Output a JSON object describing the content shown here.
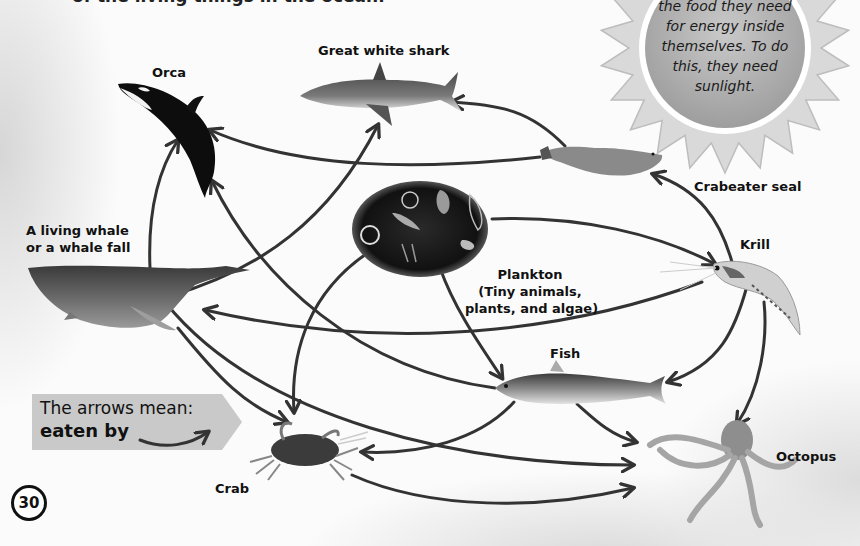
{
  "intro_text": "of the living things in the ocean.",
  "sun_box": {
    "lines": [
      "the food they need",
      "for energy inside",
      "themselves. To do",
      "this, they need",
      "sunlight."
    ]
  },
  "organisms": {
    "orca": "Orca",
    "shark": "Great white shark",
    "seal": "Crabeater seal",
    "krill": "Krill",
    "whale_line1": "A living whale",
    "whale_line2": "or a whale fall",
    "plankton_line1": "Plankton",
    "plankton_line2": "(Tiny animals,",
    "plankton_line3": "plants, and algae)",
    "fish": "Fish",
    "crab": "Crab",
    "octopus": "Octopus"
  },
  "legend": {
    "line1": "The arrows mean:",
    "line2": "eaten by"
  },
  "page_number": "30",
  "food_web_links": [
    {
      "from": "Crabeater seal",
      "to": "Great white shark"
    },
    {
      "from": "Crabeater seal",
      "to": "Orca"
    },
    {
      "from": "Krill",
      "to": "Crabeater seal"
    },
    {
      "from": "Plankton",
      "to": "Krill"
    },
    {
      "from": "Plankton",
      "to": "Fish"
    },
    {
      "from": "Plankton",
      "to": "Crab"
    },
    {
      "from": "Krill",
      "to": "Whale"
    },
    {
      "from": "Krill",
      "to": "Fish"
    },
    {
      "from": "Krill",
      "to": "Octopus"
    },
    {
      "from": "Whale",
      "to": "Orca"
    },
    {
      "from": "Whale",
      "to": "Great white shark"
    },
    {
      "from": "Whale",
      "to": "Crab"
    },
    {
      "from": "Whale",
      "to": "Octopus"
    },
    {
      "from": "Fish",
      "to": "Orca"
    },
    {
      "from": "Fish",
      "to": "Crab"
    },
    {
      "from": "Fish",
      "to": "Octopus"
    },
    {
      "from": "Crab",
      "to": "Octopus"
    }
  ],
  "colors": {
    "arrow": "#333333",
    "sun_fill": "#d4d4d4",
    "sun_inner": "#b5b5b5",
    "legend_fill": "#c9c9c9"
  }
}
